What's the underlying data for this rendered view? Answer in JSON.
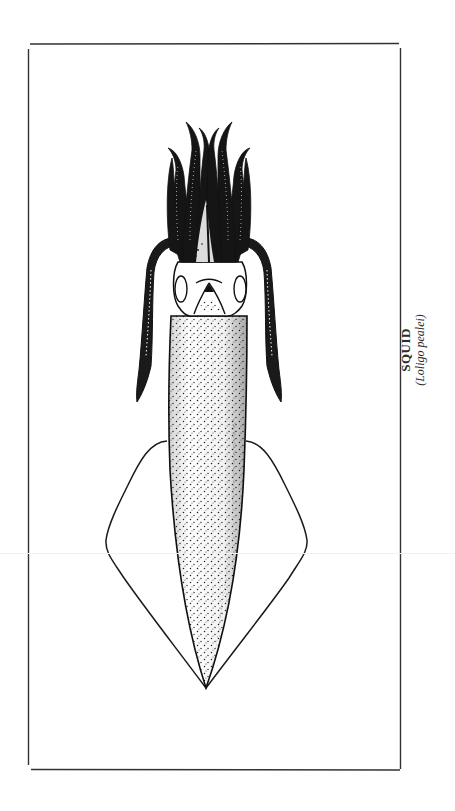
{
  "figure": {
    "caption_title": "SQUID",
    "caption_scientific": "(Loligo pealei)",
    "colors": {
      "ink": "#1a1a1a",
      "paper": "#ffffff",
      "frame": "#333333"
    },
    "frame": {
      "left": 28,
      "top": 44,
      "right": 401,
      "bottom": 770
    }
  }
}
